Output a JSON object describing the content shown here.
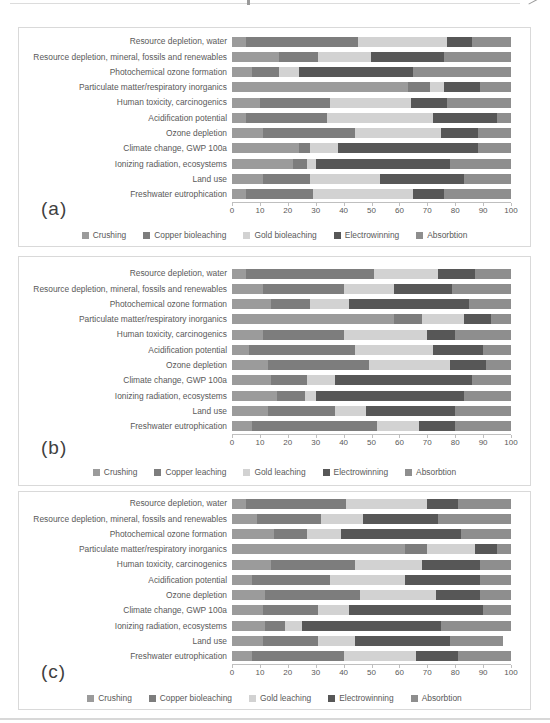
{
  "series_colors": [
    "#9b9b9b",
    "#7d7d7d",
    "#d2d2d2",
    "#575757",
    "#8e8e8e"
  ],
  "chart_data": [
    {
      "type": "bar",
      "orientation": "horizontal",
      "stacked": true,
      "panel_label": "(a)",
      "xlim": [
        0,
        100
      ],
      "x_ticks": [
        0,
        10,
        20,
        30,
        40,
        50,
        60,
        70,
        80,
        90,
        100
      ],
      "grid": true,
      "legend_position": "bottom",
      "categories": [
        "Resource depletion, water",
        "Resource depletion, mineral, fossils and renewables",
        "Photochemical ozone formation",
        "Particulate matter/respiratory inorganics",
        "Human toxicity, carcinogenics",
        "Acidification potential",
        "Ozone depletion",
        "Climate change, GWP 100a",
        "Ionizing radiation, ecosystems",
        "Land use",
        "Freshwater eutrophication"
      ],
      "series": [
        {
          "name": "Crushing",
          "values": [
            5,
            17,
            7,
            63,
            10,
            5,
            11,
            24,
            22,
            11,
            5
          ]
        },
        {
          "name": "Copper bioleaching",
          "values": [
            40,
            14,
            10,
            8,
            25,
            29,
            33,
            4,
            5,
            17,
            24
          ]
        },
        {
          "name": "Gold bioleaching",
          "values": [
            32,
            19,
            7,
            5,
            29,
            38,
            31,
            10,
            3,
            25,
            36
          ]
        },
        {
          "name": "Electrowinning",
          "values": [
            9,
            26,
            41,
            13,
            13,
            23,
            13,
            50,
            48,
            30,
            11
          ]
        },
        {
          "name": "Absorbtion",
          "values": [
            14,
            24,
            35,
            11,
            23,
            5,
            12,
            12,
            22,
            17,
            24
          ]
        }
      ]
    },
    {
      "type": "bar",
      "orientation": "horizontal",
      "stacked": true,
      "panel_label": "(b)",
      "xlim": [
        0,
        100
      ],
      "x_ticks": [
        0,
        10,
        20,
        30,
        40,
        50,
        60,
        70,
        80,
        90,
        100
      ],
      "grid": true,
      "legend_position": "bottom",
      "categories": [
        "Resource depletion, water",
        "Resource depletion, mineral, fossils and renewables",
        "Photochemical ozone formation",
        "Particulate matter/respiratory inorganics",
        "Human toxicity, carcinogenics",
        "Acidification potential",
        "Ozone depletion",
        "Climate change, GWP 100a",
        "Ionizing radiation, ecosystems",
        "Land use",
        "Freshwater eutrophication"
      ],
      "series": [
        {
          "name": "Crushing",
          "values": [
            5,
            11,
            14,
            58,
            11,
            6,
            13,
            14,
            16,
            13,
            7
          ]
        },
        {
          "name": "Copper leaching",
          "values": [
            46,
            29,
            14,
            10,
            29,
            38,
            36,
            13,
            10,
            24,
            45
          ]
        },
        {
          "name": "Gold leaching",
          "values": [
            23,
            18,
            14,
            15,
            30,
            28,
            29,
            10,
            4,
            11,
            15
          ]
        },
        {
          "name": "Electrowinning",
          "values": [
            13,
            21,
            43,
            10,
            10,
            18,
            13,
            49,
            53,
            32,
            13
          ]
        },
        {
          "name": "Absorbtion",
          "values": [
            13,
            21,
            15,
            7,
            20,
            10,
            9,
            14,
            17,
            20,
            20
          ]
        }
      ]
    },
    {
      "type": "bar",
      "orientation": "horizontal",
      "stacked": true,
      "panel_label": "(c)",
      "xlim": [
        0,
        100
      ],
      "x_ticks": [
        0,
        10,
        20,
        30,
        40,
        50,
        60,
        70,
        80,
        90,
        100
      ],
      "grid": true,
      "legend_position": "bottom",
      "categories": [
        "Resource depletion, water",
        "Resource depletion, mineral, fossils and renewables",
        "Photochemical ozone formation",
        "Particulate matter/respiratory inorganics",
        "Human toxicity, carcinogenics",
        "Acidification potential",
        "Ozone depletion",
        "Climate change, GWP 100a",
        "Ionizing radiation, ecosystems",
        "Land use",
        "Freshwater eutrophication"
      ],
      "series": [
        {
          "name": "Crushing",
          "values": [
            5,
            9,
            15,
            62,
            14,
            7,
            12,
            11,
            12,
            11,
            7
          ]
        },
        {
          "name": "Copper bioleaching",
          "values": [
            36,
            23,
            12,
            8,
            30,
            28,
            34,
            20,
            7,
            20,
            33
          ]
        },
        {
          "name": "Gold leaching",
          "values": [
            29,
            15,
            12,
            17,
            24,
            27,
            27,
            11,
            6,
            13,
            26
          ]
        },
        {
          "name": "Electrowinning",
          "values": [
            11,
            27,
            43,
            8,
            21,
            27,
            16,
            48,
            50,
            34,
            15
          ]
        },
        {
          "name": "Absorbtion",
          "values": [
            19,
            26,
            18,
            5,
            11,
            11,
            11,
            10,
            25,
            19,
            19
          ]
        }
      ]
    }
  ]
}
